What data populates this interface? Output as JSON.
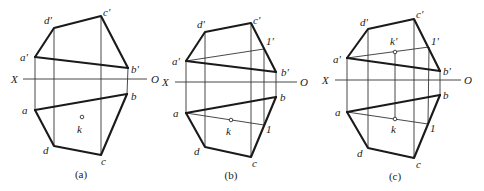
{
  "figure": {
    "colors": {
      "stroke": "#1a1a1a",
      "thin": "#333333",
      "background": "#ffffff"
    }
  },
  "panels": [
    {
      "id": "a",
      "caption": "(a)",
      "caption_pos": [
        81,
        178
      ],
      "axis": {
        "x1": 23,
        "x2": 147,
        "y": 79,
        "left_label": "X",
        "left_label_pos": [
          11,
          83
        ],
        "right_label": "O",
        "right_label_pos": [
          151,
          83
        ]
      },
      "points_front": {
        "a'": [
          35,
          57
        ],
        "d'": [
          54,
          28
        ],
        "c'": [
          101,
          16
        ],
        "b'": [
          128,
          68
        ]
      },
      "points_top": {
        "a": [
          35,
          110
        ],
        "d": [
          54,
          146
        ],
        "c": [
          101,
          155
        ],
        "b": [
          127,
          94
        ]
      },
      "k": [
        82,
        117
      ],
      "labels": [
        {
          "text": "d'",
          "pos": [
            44,
            24
          ]
        },
        {
          "text": "c'",
          "pos": [
            103,
            16
          ]
        },
        {
          "text": "a'",
          "pos": [
            20,
            61
          ]
        },
        {
          "text": "b'",
          "pos": [
            131,
            73
          ]
        },
        {
          "text": "b",
          "pos": [
            131,
            100
          ]
        },
        {
          "text": "a",
          "pos": [
            22,
            114
          ]
        },
        {
          "text": "k",
          "pos": [
            77,
            133
          ]
        },
        {
          "text": "d",
          "pos": [
            43,
            154
          ]
        },
        {
          "text": "c",
          "pos": [
            101,
            165
          ]
        }
      ]
    },
    {
      "id": "b",
      "caption": "(b)",
      "caption_pos": [
        231,
        179
      ],
      "axis": {
        "x1": 175,
        "x2": 297,
        "y": 82,
        "left_label": "X",
        "left_label_pos": [
          162,
          86
        ],
        "right_label": "O",
        "right_label_pos": [
          300,
          86
        ]
      },
      "points_front": {
        "a'": [
          186,
          61
        ],
        "d'": [
          205,
          32
        ],
        "c'": [
          251,
          23
        ],
        "b'": [
          276,
          72
        ]
      },
      "points_top": {
        "a": [
          186,
          113
        ],
        "d": [
          205,
          147
        ],
        "c": [
          251,
          157
        ],
        "b": [
          276,
          97
        ]
      },
      "one_front": [
        264,
        49
      ],
      "one_top": [
        264,
        125
      ],
      "k": [
        231,
        120
      ],
      "labels": [
        {
          "text": "d'",
          "pos": [
            197,
            28
          ]
        },
        {
          "text": "c'",
          "pos": [
            253,
            24
          ]
        },
        {
          "text": "1'",
          "pos": [
            266,
            45
          ]
        },
        {
          "text": "a'",
          "pos": [
            172,
            65
          ]
        },
        {
          "text": "b'",
          "pos": [
            281,
            76
          ]
        },
        {
          "text": "b",
          "pos": [
            280,
            101
          ]
        },
        {
          "text": "a",
          "pos": [
            173,
            117
          ]
        },
        {
          "text": "k",
          "pos": [
            226,
            135
          ]
        },
        {
          "text": "1",
          "pos": [
            266,
            133
          ]
        },
        {
          "text": "d",
          "pos": [
            194,
            155
          ]
        },
        {
          "text": "c",
          "pos": [
            252,
            167
          ]
        }
      ]
    },
    {
      "id": "c",
      "caption": "(c)",
      "caption_pos": [
        395,
        180
      ],
      "axis": {
        "x1": 335,
        "x2": 461,
        "y": 80,
        "left_label": "X",
        "left_label_pos": [
          322,
          84
        ],
        "right_label": "O",
        "right_label_pos": [
          464,
          84
        ]
      },
      "points_front": {
        "a'": [
          347,
          58
        ],
        "d'": [
          368,
          29
        ],
        "c'": [
          414,
          19
        ],
        "b'": [
          440,
          71
        ]
      },
      "points_top": {
        "a": [
          347,
          112
        ],
        "d": [
          368,
          148
        ],
        "c": [
          414,
          158
        ],
        "b": [
          440,
          95
        ]
      },
      "one_front": [
        429,
        47
      ],
      "one_top": [
        428,
        124
      ],
      "k": [
        395,
        119
      ],
      "k_front": [
        395,
        52
      ],
      "labels": [
        {
          "text": "d'",
          "pos": [
            360,
            26
          ]
        },
        {
          "text": "c'",
          "pos": [
            416,
            18
          ]
        },
        {
          "text": "k'",
          "pos": [
            390,
            45
          ]
        },
        {
          "text": "1'",
          "pos": [
            431,
            45
          ]
        },
        {
          "text": "a'",
          "pos": [
            333,
            63
          ]
        },
        {
          "text": "b'",
          "pos": [
            443,
            75
          ]
        },
        {
          "text": "b",
          "pos": [
            443,
            99
          ]
        },
        {
          "text": "a",
          "pos": [
            335,
            116
          ]
        },
        {
          "text": "k",
          "pos": [
            391,
            133
          ]
        },
        {
          "text": "1",
          "pos": [
            430,
            132
          ]
        },
        {
          "text": "d",
          "pos": [
            357,
            157
          ]
        },
        {
          "text": "c",
          "pos": [
            416,
            168
          ]
        }
      ]
    }
  ]
}
